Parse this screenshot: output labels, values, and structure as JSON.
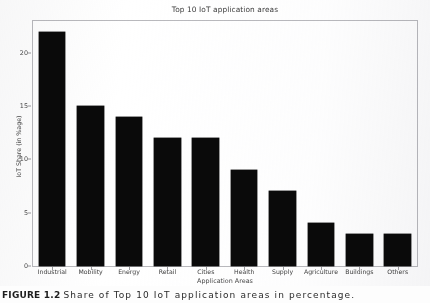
{
  "figure": {
    "caption_label": "FIGURE 1.2",
    "caption_text": "Share of Top 10 IoT application areas in percentage."
  },
  "chart_data": {
    "type": "bar",
    "title": "Top 10 IoT application areas",
    "xlabel": "Application Areas",
    "ylabel": "IoT Share (in %age)",
    "categories": [
      "Industrial",
      "Mobility",
      "Energy",
      "Retail",
      "Cities",
      "Health",
      "Supply",
      "Agriculture",
      "Buildings",
      "Others"
    ],
    "values": [
      22,
      15,
      14,
      12,
      12,
      9,
      7,
      4,
      3,
      3
    ],
    "ylim": [
      0,
      23
    ],
    "yticks": [
      0,
      5,
      10,
      15,
      20
    ],
    "ytick_labels": [
      "0",
      "5",
      "10",
      "15",
      "20"
    ],
    "grid": false,
    "legend": false,
    "bar_color": "#0a0a0a",
    "frame_color": "#b9b9bd",
    "background": "#ffffff"
  }
}
